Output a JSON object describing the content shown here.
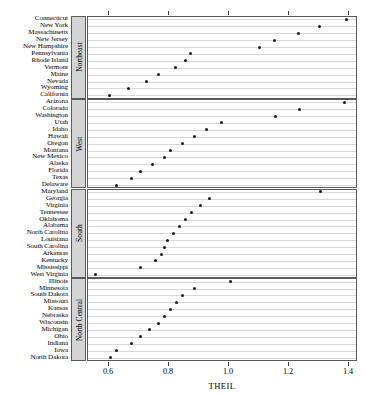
{
  "chart_data": {
    "type": "scatter",
    "title": "",
    "subtitle": "",
    "xlabel": "THEIL",
    "ylabel": "",
    "xlim": [
      0.53,
      1.43
    ],
    "xticks": [
      0.6,
      0.8,
      1.0,
      1.2,
      1.4
    ],
    "xtick_labels": [
      "0.6",
      "0.8",
      "1.0",
      "1.2",
      "1.4"
    ],
    "grid": true,
    "grid_axis": "y",
    "legend": "none",
    "panel_layout": "vertical-trellis",
    "panel_strip_position": "left-rotated",
    "point_marker": "filled-circle",
    "point_color": "#1a1a1a",
    "panels": [
      {
        "name": "Northeast",
        "categories": [
          "Connecticut",
          "New York",
          "Massachusetts",
          "New Jersey",
          "New Hampshire",
          "Pennsylvania",
          "Rhode Island",
          "Vermont",
          "Maine",
          "Nevada",
          "Wyoming",
          "California"
        ],
        "values": [
          1.39,
          1.3,
          1.23,
          1.15,
          1.1,
          0.87,
          0.855,
          0.82,
          0.765,
          0.725,
          0.665,
          0.6
        ]
      },
      {
        "name": "West",
        "categories": [
          "Arizona",
          "Colorado",
          "Washington",
          "Utah",
          "Idaho",
          "Hawaii",
          "Oregon",
          "Montana",
          "New Mexico",
          "Alaska",
          "Florida",
          "Texas",
          "Delaware"
        ],
        "values": [
          1.385,
          1.235,
          1.155,
          0.975,
          0.925,
          0.885,
          0.845,
          0.805,
          0.785,
          0.745,
          0.705,
          0.675,
          0.625
        ]
      },
      {
        "name": "South",
        "categories": [
          "Maryland",
          "Georgia",
          "Virginia",
          "Tennessee",
          "Oklahoma",
          "Alabama",
          "North Carolina",
          "Louisiana",
          "South Carolina",
          "Arkansas",
          "Kentucky",
          "Mississippi",
          "West Virginia"
        ],
        "values": [
          1.305,
          0.935,
          0.905,
          0.875,
          0.855,
          0.835,
          0.815,
          0.795,
          0.785,
          0.775,
          0.755,
          0.705,
          0.555
        ]
      },
      {
        "name": "North Central",
        "categories": [
          "Illinois",
          "Minnesota",
          "South Dakota",
          "Missouri",
          "Kansas",
          "Nebraska",
          "Wisconsin",
          "Michigan",
          "Ohio",
          "Indiana",
          "Iowa",
          "North Dakota"
        ],
        "values": [
          1.005,
          0.885,
          0.845,
          0.825,
          0.805,
          0.785,
          0.765,
          0.735,
          0.705,
          0.675,
          0.625,
          0.605
        ]
      }
    ]
  }
}
